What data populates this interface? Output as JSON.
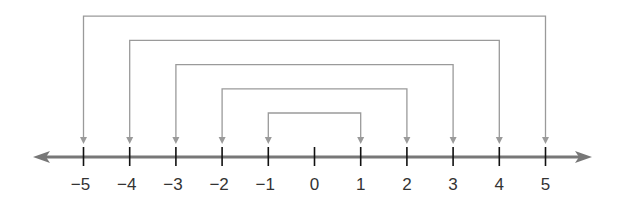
{
  "number_line": {
    "min": -5,
    "max": 5,
    "ticks": [
      {
        "value": -5,
        "label": "−5"
      },
      {
        "value": -4,
        "label": "−4"
      },
      {
        "value": -3,
        "label": "−3"
      },
      {
        "value": -2,
        "label": "−2"
      },
      {
        "value": -1,
        "label": "−1"
      },
      {
        "value": 0,
        "label": "0"
      },
      {
        "value": 1,
        "label": "1"
      },
      {
        "value": 2,
        "label": "2"
      },
      {
        "value": 3,
        "label": "3"
      },
      {
        "value": 4,
        "label": "4"
      },
      {
        "value": 5,
        "label": "5"
      }
    ],
    "arrows_both_ends": true
  },
  "brackets": [
    {
      "from": -1,
      "to": 1,
      "level": 1
    },
    {
      "from": -2,
      "to": 2,
      "level": 2
    },
    {
      "from": -3,
      "to": 3,
      "level": 3
    },
    {
      "from": -4,
      "to": 4,
      "level": 4
    },
    {
      "from": -5,
      "to": 5,
      "level": 5
    }
  ],
  "colors": {
    "axis": "#777777",
    "ticks": "#111111",
    "brackets": "#9a9a9a",
    "labels": "#333333"
  }
}
